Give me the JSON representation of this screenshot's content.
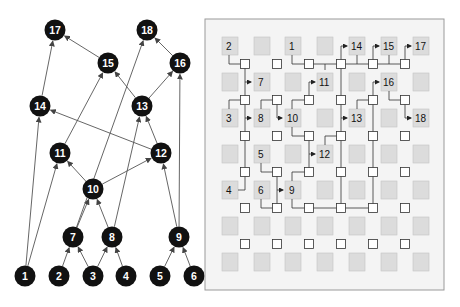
{
  "figure": {
    "left_panel": {
      "title": "DAG",
      "node_color": "#111111",
      "node_text_color": "#ffffff",
      "edge_color": "#555555",
      "nodes": [
        {
          "id": "1",
          "x": 25,
          "y": 276
        },
        {
          "id": "2",
          "x": 59,
          "y": 276
        },
        {
          "id": "3",
          "x": 93,
          "y": 276
        },
        {
          "id": "4",
          "x": 126,
          "y": 276
        },
        {
          "id": "5",
          "x": 160,
          "y": 276
        },
        {
          "id": "6",
          "x": 194,
          "y": 276
        },
        {
          "id": "7",
          "x": 73,
          "y": 237
        },
        {
          "id": "8",
          "x": 112,
          "y": 237
        },
        {
          "id": "9",
          "x": 179,
          "y": 237
        },
        {
          "id": "10",
          "x": 93,
          "y": 189
        },
        {
          "id": "11",
          "x": 60,
          "y": 153
        },
        {
          "id": "12",
          "x": 161,
          "y": 153
        },
        {
          "id": "13",
          "x": 142,
          "y": 106
        },
        {
          "id": "14",
          "x": 40,
          "y": 106
        },
        {
          "id": "15",
          "x": 108,
          "y": 63
        },
        {
          "id": "16",
          "x": 180,
          "y": 63
        },
        {
          "id": "17",
          "x": 55,
          "y": 30
        },
        {
          "id": "18",
          "x": 147,
          "y": 30
        }
      ],
      "edges": [
        [
          "1",
          "14"
        ],
        [
          "1",
          "11"
        ],
        [
          "2",
          "7"
        ],
        [
          "3",
          "7"
        ],
        [
          "3",
          "8"
        ],
        [
          "4",
          "8"
        ],
        [
          "5",
          "9"
        ],
        [
          "6",
          "9"
        ],
        [
          "7",
          "10"
        ],
        [
          "8",
          "10"
        ],
        [
          "7",
          "18"
        ],
        [
          "8",
          "13"
        ],
        [
          "9",
          "12"
        ],
        [
          "9",
          "16"
        ],
        [
          "10",
          "11"
        ],
        [
          "10",
          "12"
        ],
        [
          "11",
          "15"
        ],
        [
          "12",
          "14"
        ],
        [
          "12",
          "13"
        ],
        [
          "13",
          "15"
        ],
        [
          "13",
          "16"
        ],
        [
          "14",
          "17"
        ],
        [
          "15",
          "17"
        ],
        [
          "16",
          "18"
        ]
      ]
    },
    "right_panel": {
      "title": "Grid placement and routing",
      "panel": {
        "x": 205,
        "y": 19,
        "w": 239,
        "h": 271,
        "fill": "#f4f4f4",
        "stroke": "#9a9a9a"
      },
      "tile_fill": "#dcdcdc",
      "tile_stroke": "#c4c4c4",
      "switch_fill": "#ffffff",
      "switch_stroke": "#333333",
      "wire_color": "#333333",
      "tile_cols_x": [
        222,
        254,
        285,
        317,
        349,
        381,
        413
      ],
      "tile_rows_y": [
        37,
        73,
        109,
        145,
        181,
        217,
        253
      ],
      "tile_size": 16,
      "switch_cols_x": [
        245,
        277,
        309,
        341,
        373,
        405
      ],
      "switch_rows_y": [
        64,
        100,
        136,
        172,
        208,
        244
      ],
      "switch_size": 9,
      "labeled_tiles": [
        {
          "label": "2",
          "col": 0,
          "row": 0
        },
        {
          "label": "1",
          "col": 2,
          "row": 0
        },
        {
          "label": "14",
          "col": 4,
          "row": 0
        },
        {
          "label": "15",
          "col": 5,
          "row": 0
        },
        {
          "label": "17",
          "col": 6,
          "row": 0
        },
        {
          "label": "7",
          "col": 1,
          "row": 1
        },
        {
          "label": "11",
          "col": 3,
          "row": 1
        },
        {
          "label": "16",
          "col": 5,
          "row": 1
        },
        {
          "label": "3",
          "col": 0,
          "row": 2
        },
        {
          "label": "8",
          "col": 1,
          "row": 2
        },
        {
          "label": "10",
          "col": 2,
          "row": 2
        },
        {
          "label": "13",
          "col": 4,
          "row": 2
        },
        {
          "label": "18",
          "col": 6,
          "row": 2
        },
        {
          "label": "5",
          "col": 1,
          "row": 3
        },
        {
          "label": "12",
          "col": 3,
          "row": 3
        },
        {
          "label": "4",
          "col": 0,
          "row": 4
        },
        {
          "label": "6",
          "col": 1,
          "row": 4
        },
        {
          "label": "9",
          "col": 2,
          "row": 4
        }
      ],
      "wires": [
        {
          "points": [
            [
              229,
              55
            ],
            [
              229,
              64
            ],
            [
              241,
              64
            ]
          ]
        },
        {
          "points": [
            [
              245,
              68
            ],
            [
              245,
              96
            ]
          ]
        },
        {
          "points": [
            [
              245,
              82
            ],
            [
              251,
              82
            ]
          ],
          "arrow": true
        },
        {
          "points": [
            [
              245,
              104
            ],
            [
              245,
              132
            ]
          ]
        },
        {
          "points": [
            [
              245,
              118
            ],
            [
              251,
              118
            ]
          ],
          "arrow": true
        },
        {
          "points": [
            [
              245,
              140
            ],
            [
              245,
              168
            ]
          ]
        },
        {
          "points": [
            [
              245,
              176
            ],
            [
              245,
              190
            ],
            [
              238,
              190
            ]
          ]
        },
        {
          "points": [
            [
              229,
              109
            ],
            [
              229,
              100
            ],
            [
              241,
              100
            ]
          ]
        },
        {
          "points": [
            [
              261,
              109
            ],
            [
              261,
              100
            ],
            [
              273,
              100
            ]
          ]
        },
        {
          "points": [
            [
              277,
              104
            ],
            [
              277,
              118
            ],
            [
              282,
              118
            ]
          ],
          "arrow": true
        },
        {
          "points": [
            [
              292,
              55
            ],
            [
              292,
              64
            ],
            [
              305,
              64
            ]
          ]
        },
        {
          "points": [
            [
              313,
              64
            ],
            [
              337,
              64
            ]
          ]
        },
        {
          "points": [
            [
              325,
              64
            ],
            [
              325,
              70
            ]
          ]
        },
        {
          "points": [
            [
              345,
              64
            ],
            [
              369,
              64
            ]
          ]
        },
        {
          "points": [
            [
              341,
              60
            ],
            [
              341,
              46
            ],
            [
              347,
              46
            ]
          ],
          "arrow": true
        },
        {
          "points": [
            [
              357,
              55
            ],
            [
              357,
              64
            ]
          ]
        },
        {
          "points": [
            [
              377,
              64
            ],
            [
              401,
              64
            ]
          ]
        },
        {
          "points": [
            [
              373,
              60
            ],
            [
              373,
              46
            ],
            [
              379,
              46
            ]
          ],
          "arrow": true
        },
        {
          "points": [
            [
              389,
              55
            ],
            [
              389,
              64
            ]
          ]
        },
        {
          "points": [
            [
              405,
              60
            ],
            [
              405,
              46
            ],
            [
              411,
              46
            ]
          ],
          "arrow": true
        },
        {
          "points": [
            [
              309,
              96
            ],
            [
              309,
              82
            ],
            [
              315,
              82
            ]
          ],
          "arrow": true
        },
        {
          "points": [
            [
              341,
              68
            ],
            [
              341,
              96
            ]
          ]
        },
        {
          "points": [
            [
              341,
              104
            ],
            [
              341,
              132
            ]
          ]
        },
        {
          "points": [
            [
              341,
              118
            ],
            [
              347,
              118
            ]
          ],
          "arrow": true
        },
        {
          "points": [
            [
              341,
              140
            ],
            [
              341,
              168
            ]
          ]
        },
        {
          "points": [
            [
              341,
              176
            ],
            [
              341,
              204
            ]
          ]
        },
        {
          "points": [
            [
              292,
              109
            ],
            [
              292,
              100
            ],
            [
              305,
              100
            ]
          ]
        },
        {
          "points": [
            [
              373,
              96
            ],
            [
              373,
              82
            ],
            [
              379,
              82
            ]
          ],
          "arrow": true
        },
        {
          "points": [
            [
              357,
              109
            ],
            [
              357,
              100
            ],
            [
              369,
              100
            ]
          ]
        },
        {
          "points": [
            [
              373,
              104
            ],
            [
              373,
              204
            ]
          ]
        },
        {
          "points": [
            [
              389,
              91
            ],
            [
              389,
              100
            ],
            [
              401,
              100
            ]
          ]
        },
        {
          "points": [
            [
              405,
              104
            ],
            [
              405,
              118
            ],
            [
              411,
              118
            ]
          ],
          "arrow": true
        },
        {
          "points": [
            [
              292,
              127
            ],
            [
              292,
              136
            ],
            [
              305,
              136
            ]
          ]
        },
        {
          "points": [
            [
              309,
              140
            ],
            [
              309,
              168
            ]
          ]
        },
        {
          "points": [
            [
              309,
              154
            ],
            [
              315,
              154
            ]
          ],
          "arrow": true
        },
        {
          "points": [
            [
              325,
              145
            ],
            [
              325,
              136
            ],
            [
              337,
              136
            ]
          ]
        },
        {
          "points": [
            [
              261,
              163
            ],
            [
              261,
              172
            ],
            [
              273,
              172
            ]
          ]
        },
        {
          "points": [
            [
              277,
              176
            ],
            [
              277,
              204
            ]
          ]
        },
        {
          "points": [
            [
              261,
              199
            ],
            [
              261,
              208
            ],
            [
              273,
              208
            ]
          ]
        },
        {
          "points": [
            [
              277,
              190
            ],
            [
              283,
              190
            ]
          ],
          "arrow": true
        },
        {
          "points": [
            [
              292,
              181
            ],
            [
              292,
              172
            ],
            [
              305,
              172
            ]
          ]
        },
        {
          "points": [
            [
              292,
              199
            ],
            [
              292,
              208
            ],
            [
              305,
              208
            ]
          ]
        },
        {
          "points": [
            [
              313,
              208
            ],
            [
              337,
              208
            ]
          ]
        },
        {
          "points": [
            [
              345,
              208
            ],
            [
              369,
              208
            ]
          ]
        }
      ]
    }
  }
}
